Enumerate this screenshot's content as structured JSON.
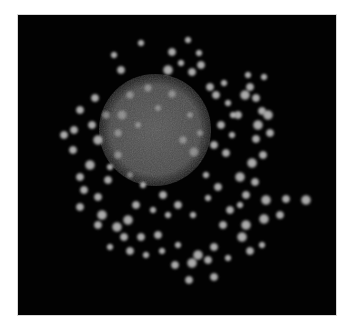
{
  "image": {
    "description": "Grayscale fluorescence micrograph: a large dim granular sphere surrounded by many bright round vesicles on a black background",
    "colors": {
      "background": "#020202",
      "page": "#ffffff",
      "sphere": "#4a4a4a",
      "vesicle": "#b4b4b4"
    },
    "sphere": {
      "cx": 137,
      "cy": 115,
      "r": 56
    },
    "vesicles": [
      [
        123,
        28,
        4
      ],
      [
        170,
        25,
        4
      ],
      [
        96,
        40,
        4
      ],
      [
        154,
        37,
        5
      ],
      [
        181,
        38,
        4
      ],
      [
        163,
        48,
        4
      ],
      [
        183,
        50,
        5
      ],
      [
        150,
        55,
        6
      ],
      [
        103,
        55,
        5
      ],
      [
        174,
        57,
        5
      ],
      [
        192,
        72,
        5
      ],
      [
        206,
        68,
        4
      ],
      [
        232,
        72,
        5
      ],
      [
        227,
        80,
        6
      ],
      [
        238,
        83,
        5
      ],
      [
        244,
        96,
        5
      ],
      [
        250,
        100,
        6
      ],
      [
        240,
        110,
        6
      ],
      [
        252,
        118,
        5
      ],
      [
        238,
        124,
        5
      ],
      [
        245,
        140,
        5
      ],
      [
        234,
        148,
        6
      ],
      [
        222,
        162,
        6
      ],
      [
        237,
        167,
        5
      ],
      [
        228,
        180,
        5
      ],
      [
        248,
        185,
        6
      ],
      [
        268,
        184,
        5
      ],
      [
        288,
        185,
        6
      ],
      [
        246,
        204,
        6
      ],
      [
        228,
        210,
        6
      ],
      [
        224,
        222,
        6
      ],
      [
        205,
        210,
        5
      ],
      [
        212,
        195,
        5
      ],
      [
        200,
        172,
        5
      ],
      [
        190,
        183,
        4
      ],
      [
        196,
        232,
        5
      ],
      [
        180,
        240,
        6
      ],
      [
        174,
        248,
        6
      ],
      [
        190,
        245,
        5
      ],
      [
        210,
        243,
        4
      ],
      [
        196,
        262,
        5
      ],
      [
        171,
        265,
        5
      ],
      [
        157,
        250,
        5
      ],
      [
        140,
        220,
        5
      ],
      [
        123,
        222,
        5
      ],
      [
        110,
        205,
        6
      ],
      [
        106,
        222,
        5
      ],
      [
        99,
        212,
        6
      ],
      [
        84,
        200,
        6
      ],
      [
        80,
        210,
        5
      ],
      [
        62,
        192,
        5
      ],
      [
        66,
        175,
        5
      ],
      [
        80,
        182,
        5
      ],
      [
        62,
        162,
        5
      ],
      [
        72,
        150,
        6
      ],
      [
        90,
        165,
        5
      ],
      [
        55,
        135,
        5
      ],
      [
        46,
        120,
        5
      ],
      [
        56,
        115,
        5
      ],
      [
        74,
        110,
        5
      ],
      [
        80,
        125,
        6
      ],
      [
        100,
        118,
        5
      ],
      [
        104,
        100,
        6
      ],
      [
        88,
        100,
        5
      ],
      [
        62,
        95,
        5
      ],
      [
        77,
        83,
        5
      ],
      [
        112,
        80,
        5
      ],
      [
        130,
        73,
        5
      ],
      [
        140,
        93,
        4
      ],
      [
        120,
        110,
        4
      ],
      [
        100,
        140,
        5
      ],
      [
        92,
        152,
        4
      ],
      [
        112,
        160,
        4
      ],
      [
        125,
        170,
        4
      ],
      [
        145,
        180,
        5
      ],
      [
        160,
        190,
        5
      ],
      [
        175,
        200,
        4
      ],
      [
        150,
        200,
        4
      ],
      [
        135,
        195,
        4
      ],
      [
        118,
        190,
        5
      ],
      [
        203,
        110,
        5
      ],
      [
        196,
        130,
        5
      ],
      [
        208,
        138,
        5
      ],
      [
        214,
        120,
        4
      ],
      [
        220,
        100,
        5
      ],
      [
        210,
        88,
        4
      ],
      [
        198,
        80,
        5
      ],
      [
        182,
        118,
        4
      ],
      [
        176,
        137,
        6
      ],
      [
        188,
        160,
        4
      ],
      [
        165,
        125,
        5
      ],
      [
        172,
        100,
        4
      ],
      [
        154,
        79,
        5
      ],
      [
        222,
        190,
        4
      ],
      [
        262,
        200,
        5
      ],
      [
        244,
        230,
        4
      ],
      [
        232,
        236,
        5
      ],
      [
        160,
        230,
        4
      ],
      [
        144,
        236,
        4
      ],
      [
        128,
        240,
        4
      ],
      [
        112,
        236,
        5
      ],
      [
        92,
        232,
        4
      ],
      [
        215,
        100,
        4
      ],
      [
        230,
        60,
        4
      ],
      [
        246,
        62,
        4
      ]
    ]
  }
}
